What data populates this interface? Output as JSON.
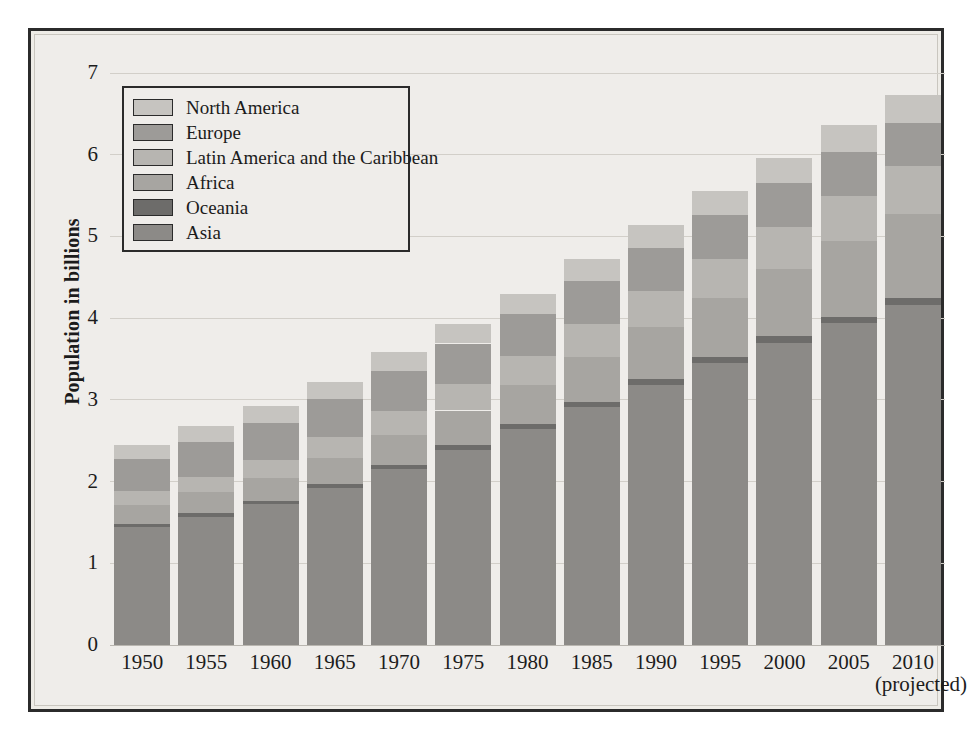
{
  "chart_data": {
    "type": "bar",
    "stacked": true,
    "title": "",
    "xlabel": "",
    "ylabel": "Population in billions",
    "ylim": [
      0,
      7
    ],
    "yticks": [
      0,
      1,
      2,
      3,
      4,
      5,
      6,
      7
    ],
    "ytick_labels": [
      "0",
      "1",
      "2",
      "3",
      "4",
      "5",
      "6",
      "7"
    ],
    "grid": true,
    "legend_position": "upper-left",
    "categories": [
      "1950",
      "1955",
      "1960",
      "1965",
      "1970",
      "1975",
      "1980",
      "1985",
      "1990",
      "1995",
      "2000",
      "2005",
      "2010"
    ],
    "category_notes": {
      "2010": "(projected)"
    },
    "series": [
      {
        "name": "Asia",
        "color": "#8c8a87",
        "values": [
          1.44,
          1.57,
          1.72,
          1.92,
          2.15,
          2.39,
          2.64,
          2.91,
          3.18,
          3.45,
          3.7,
          3.94,
          4.16
        ]
      },
      {
        "name": "Oceania",
        "color": "#6d6c6a",
        "values": [
          0.04,
          0.04,
          0.04,
          0.05,
          0.05,
          0.06,
          0.06,
          0.06,
          0.07,
          0.07,
          0.08,
          0.08,
          0.09
        ]
      },
      {
        "name": "Africa",
        "color": "#a7a5a1",
        "values": [
          0.23,
          0.26,
          0.29,
          0.32,
          0.37,
          0.42,
          0.48,
          0.56,
          0.64,
          0.73,
          0.82,
          0.92,
          1.02
        ]
      },
      {
        "name": "Latin America and the Caribbean",
        "color": "#b7b5b1",
        "values": [
          0.17,
          0.19,
          0.22,
          0.25,
          0.29,
          0.32,
          0.36,
          0.4,
          0.44,
          0.48,
          0.52,
          0.56,
          0.59
        ]
      },
      {
        "name": "Europe",
        "color": "#9d9b98",
        "values": [
          0.4,
          0.43,
          0.45,
          0.47,
          0.49,
          0.5,
          0.51,
          0.52,
          0.53,
          0.53,
          0.53,
          0.53,
          0.53
        ]
      },
      {
        "name": "North America",
        "color": "#c6c4c0",
        "values": [
          0.17,
          0.19,
          0.2,
          0.21,
          0.23,
          0.24,
          0.25,
          0.27,
          0.28,
          0.3,
          0.31,
          0.33,
          0.34
        ]
      }
    ],
    "totals": [
      2.45,
      2.68,
      2.92,
      3.22,
      3.58,
      3.93,
      4.3,
      4.72,
      5.14,
      5.56,
      5.96,
      6.36,
      6.73
    ],
    "legend_order": [
      "North America",
      "Europe",
      "Latin America and the Caribbean",
      "Africa",
      "Oceania",
      "Asia"
    ]
  },
  "legend": {
    "items": [
      {
        "label": "North America",
        "color": "#c6c4c0"
      },
      {
        "label": "Europe",
        "color": "#9d9b98"
      },
      {
        "label": "Latin America and the Caribbean",
        "color": "#b7b5b1"
      },
      {
        "label": "Africa",
        "color": "#a7a5a1"
      },
      {
        "label": "Oceania",
        "color": "#6d6c6a"
      },
      {
        "label": "Asia",
        "color": "#8c8a87"
      }
    ]
  },
  "axes": {
    "y_title": "Population in billions",
    "y_tick_labels": [
      "7",
      "6",
      "5",
      "4",
      "3",
      "2",
      "1",
      "0"
    ],
    "x_tick_labels": [
      "1950",
      "1955",
      "1960",
      "1965",
      "1970",
      "1975",
      "1980",
      "1985",
      "1990",
      "1995",
      "2000",
      "2005",
      "2010"
    ],
    "x_tick_sublabel": "(projected)"
  },
  "colors": {
    "figure_background": "#efedea",
    "frame_border": "#2b2b2b",
    "gridline": "#d2cfc9",
    "text": "#1b1b1b"
  }
}
